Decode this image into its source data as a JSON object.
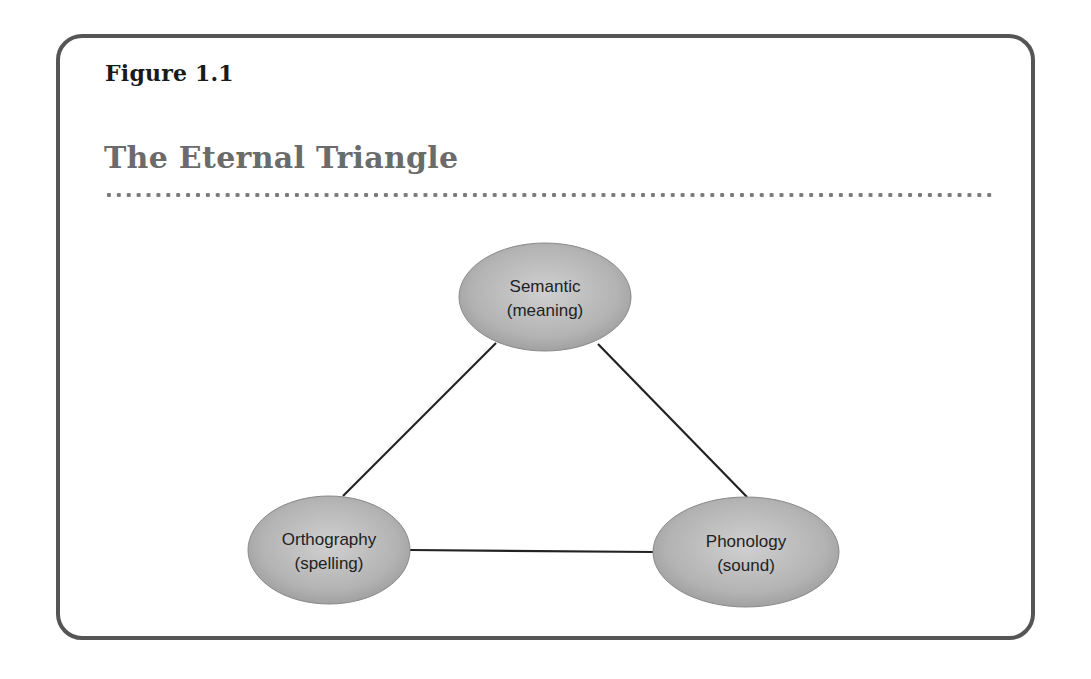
{
  "figure": {
    "label": "Figure 1.1",
    "title": "The Eternal Triangle"
  },
  "diagram": {
    "type": "triangle",
    "colors": {
      "frame": "#555555",
      "title": "#6b6b6b",
      "node_fill": "#b5b5b5",
      "edge": "#222222"
    },
    "nodes": [
      {
        "id": "semantic",
        "line1": "Semantic",
        "line2": "(meaning)"
      },
      {
        "id": "orthography",
        "line1": "Orthography",
        "line2": "(spelling)"
      },
      {
        "id": "phonology",
        "line1": "Phonology",
        "line2": "(sound)"
      }
    ],
    "edges": [
      {
        "from": "semantic",
        "to": "orthography"
      },
      {
        "from": "semantic",
        "to": "phonology"
      },
      {
        "from": "orthography",
        "to": "phonology"
      }
    ]
  }
}
